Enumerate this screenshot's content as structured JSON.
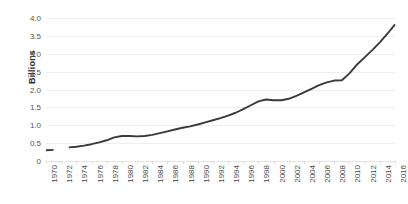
{
  "chart_data": {
    "type": "line",
    "title": "",
    "xlabel": "",
    "ylabel": "Billions",
    "ylim": [
      0,
      4.0
    ],
    "xlim": [
      1970,
      2016
    ],
    "grid": true,
    "legend": false,
    "line_color": "#3a3a3a",
    "gridline_color": "#eeeeee",
    "y_ticks": [
      "4.0",
      "3.5",
      "3.0",
      "2.5",
      "2.0",
      "1.5",
      "1.0",
      "0.5",
      "0"
    ],
    "y_tick_values": [
      4.0,
      3.5,
      3.0,
      2.5,
      2.0,
      1.5,
      1.0,
      0.5,
      0
    ],
    "x_tick_labels": [
      "1970",
      "1972",
      "1974",
      "1976",
      "1978",
      "1980",
      "1982",
      "1984",
      "1986",
      "1988",
      "1990",
      "1992",
      "1994",
      "1996",
      "1998",
      "2000",
      "2002",
      "2004",
      "2006",
      "2008",
      "2010",
      "2012",
      "2014",
      "2016"
    ],
    "x": [
      1970,
      1971,
      1972,
      1973,
      1974,
      1975,
      1976,
      1977,
      1978,
      1979,
      1980,
      1981,
      1982,
      1983,
      1984,
      1985,
      1986,
      1987,
      1988,
      1989,
      1990,
      1991,
      1992,
      1993,
      1994,
      1995,
      1996,
      1997,
      1998,
      1999,
      2000,
      2001,
      2002,
      2003,
      2004,
      2005,
      2006,
      2007,
      2008,
      2009,
      2010,
      2011,
      2012,
      2013,
      2014,
      2015,
      2016
    ],
    "values": [
      0.3,
      0.31,
      null,
      0.38,
      0.4,
      0.43,
      0.47,
      0.52,
      0.58,
      0.66,
      0.7,
      0.7,
      0.69,
      0.7,
      0.73,
      0.78,
      0.83,
      0.88,
      0.93,
      0.97,
      1.02,
      1.08,
      1.14,
      1.2,
      1.27,
      1.35,
      1.45,
      1.56,
      1.67,
      1.72,
      1.7,
      1.7,
      1.74,
      1.82,
      1.92,
      2.02,
      2.12,
      2.2,
      2.25,
      2.26,
      2.45,
      2.7,
      2.9,
      3.1,
      3.32,
      3.56,
      3.82
    ],
    "series_name": "",
    "note": "gap in line between 1971 and 1973"
  }
}
